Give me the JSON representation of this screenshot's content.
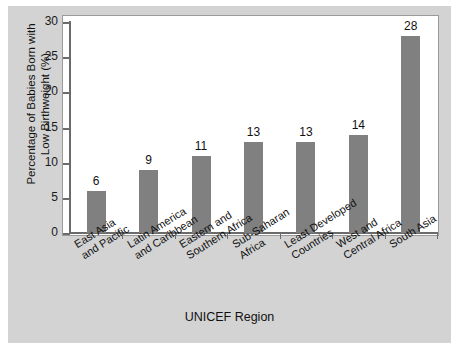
{
  "chart_data": {
    "type": "bar",
    "title": "",
    "xlabel": "UNICEF Region",
    "ylabel": "Percentage of Babies Born with\nLow Birthweight (%)",
    "ylabel_line1": "Percentage of Babies Born with",
    "ylabel_line2": "Low Birthweight (%)",
    "categories": [
      "East Asia and Pacific",
      "Latin America and Caribbean",
      "Eastern and Southern Africa",
      "Sub-Saharan Africa",
      "Least Developed Countries",
      "West and Central Africa",
      "South Asia"
    ],
    "category_lines": [
      [
        "East Asia",
        "and Pacific"
      ],
      [
        "Latin America",
        "and Caribbean"
      ],
      [
        "Eastern and",
        "Southern Africa"
      ],
      [
        "Sub-Saharan",
        "Africa"
      ],
      [
        "Least Developed",
        "Countries"
      ],
      [
        "West and",
        "Central Africa"
      ],
      [
        "South Asia",
        ""
      ]
    ],
    "values": [
      6,
      9,
      11,
      13,
      13,
      14,
      28
    ],
    "value_labels": [
      "6",
      "9",
      "11",
      "13",
      "13",
      "14",
      "28"
    ],
    "ylim": [
      0,
      30
    ],
    "yticks": [
      0,
      5,
      10,
      15,
      20,
      25,
      30
    ],
    "ytick_labels": [
      "0",
      "5",
      "10",
      "15",
      "20",
      "25",
      "30"
    ],
    "grid": false,
    "legend": false,
    "bar_color": "#808080",
    "plot_background": "#ffffff",
    "figure_background": "#d3d3d3",
    "axis_color": "#6b6b6b",
    "text_color": "#111111"
  }
}
